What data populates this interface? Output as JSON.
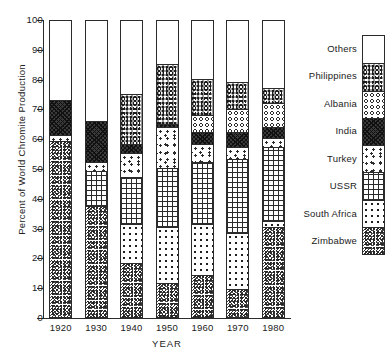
{
  "chart_data": {
    "type": "bar",
    "stacked": true,
    "stack_mode": "percent",
    "title": "",
    "xlabel": "YEAR",
    "ylabel": "Percent of World Chromite Production",
    "categories": [
      "1920",
      "1930",
      "1940",
      "1950",
      "1960",
      "1970",
      "1980"
    ],
    "ylim": [
      0,
      100
    ],
    "yticks": [
      0,
      10,
      20,
      30,
      40,
      50,
      60,
      70,
      80,
      90,
      100
    ],
    "grid": false,
    "legend_position": "right",
    "stack_order_bottom_to_top": [
      "Zimbabwe",
      "South Africa",
      "USSR",
      "Turkey",
      "India",
      "Albania",
      "Philippines",
      "Others"
    ],
    "series": [
      {
        "name": "Zimbabwe",
        "pattern": "dense-speckle",
        "values": [
          59,
          37,
          18,
          11,
          14,
          9,
          30
        ]
      },
      {
        "name": "South Africa",
        "pattern": "polka-dots",
        "values": [
          0,
          0,
          13,
          19,
          17,
          19,
          2
        ]
      },
      {
        "name": "USSR",
        "pattern": "cross-hatch-grid",
        "values": [
          0,
          12,
          16,
          20,
          21,
          25,
          25
        ]
      },
      {
        "name": "Turkey",
        "pattern": "fine-stipple",
        "values": [
          2,
          3,
          8,
          14,
          6,
          4,
          3
        ]
      },
      {
        "name": "India",
        "pattern": "dark-hatch",
        "values": [
          12,
          14,
          3,
          1,
          4,
          5,
          4
        ]
      },
      {
        "name": "Albania",
        "pattern": "open-circles",
        "values": [
          0,
          0,
          0,
          0,
          6,
          8,
          8
        ]
      },
      {
        "name": "Philippines",
        "pattern": "coarse-grain",
        "values": [
          0,
          0,
          17,
          20,
          12,
          9,
          5
        ]
      },
      {
        "name": "Others",
        "pattern": "plain-white",
        "values": [
          27,
          34,
          25,
          15,
          20,
          21,
          23
        ]
      }
    ]
  },
  "legend": {
    "entries": [
      {
        "label": "Others"
      },
      {
        "label": "Philippines"
      },
      {
        "label": "Albania"
      },
      {
        "label": "India"
      },
      {
        "label": "Turkey"
      },
      {
        "label": "USSR"
      },
      {
        "label": "South Africa"
      },
      {
        "label": "Zimbabwe"
      }
    ]
  }
}
